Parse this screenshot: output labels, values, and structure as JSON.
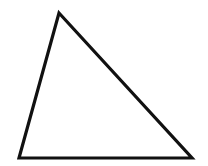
{
  "figure": {
    "name": "triangle",
    "canvas": {
      "width": 208,
      "height": 166,
      "background_color": "#ffffff"
    },
    "shape": {
      "type": "triangle",
      "stroke_color": "#111111",
      "stroke_width": 3.2,
      "fill": "none",
      "vertices": [
        {
          "label": "apex",
          "x": 59,
          "y": 13
        },
        {
          "label": "bottom-right",
          "x": 192,
          "y": 158
        },
        {
          "label": "bottom-left",
          "x": 19,
          "y": 158
        }
      ],
      "points_attr": "59,13 192,158 19,158",
      "edges": [
        {
          "label": "left-side",
          "from": "apex",
          "to": "bottom-left"
        },
        {
          "label": "hypotenuse",
          "from": "apex",
          "to": "bottom-right"
        },
        {
          "label": "base",
          "from": "bottom-left",
          "to": "bottom-right"
        }
      ]
    }
  }
}
